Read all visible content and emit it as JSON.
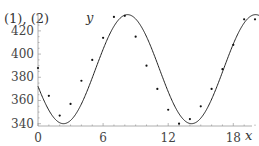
{
  "figure": {
    "top_label": "S.2.2 (cont.)",
    "panel_label": "(1), (2)",
    "y_axis_label": "y",
    "x_axis_label": "x"
  },
  "chart_data": {
    "type": "scatter",
    "title": "",
    "xlabel": "x",
    "ylabel": "y",
    "xlim": [
      0,
      21
    ],
    "ylim": [
      338,
      435
    ],
    "x_ticks": [
      0,
      6,
      12,
      18
    ],
    "y_ticks": [
      340,
      360,
      380,
      400,
      420
    ],
    "grid": false,
    "legend": "none",
    "series": [
      {
        "name": "data points",
        "kind": "scatter",
        "x": [
          0,
          1,
          2,
          3,
          4,
          5,
          6,
          7,
          8,
          9,
          10,
          11,
          12,
          13,
          14,
          15,
          16,
          17,
          18,
          19,
          20,
          21
        ],
        "values": [
          388,
          364,
          347,
          357,
          377,
          395,
          414,
          432,
          433,
          415,
          390,
          370,
          352,
          340,
          344,
          355,
          370,
          387,
          408,
          430,
          430,
          418
        ]
      },
      {
        "name": "fitted sinusoid",
        "kind": "line",
        "model": "y = 387 + 47*sin(2*pi*(x - 5.3)/11.8)",
        "amplitude": 47,
        "midline": 387,
        "period": 11.8,
        "phase_shift": 5.3
      }
    ]
  }
}
